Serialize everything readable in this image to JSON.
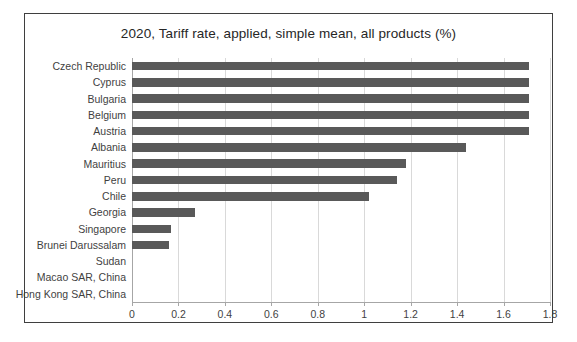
{
  "chart_data": {
    "type": "bar",
    "orientation": "horizontal",
    "title": "2020, Tariff rate, applied, simple mean, all products (%)",
    "xlabel": "",
    "ylabel": "",
    "xlim": [
      0,
      1.8
    ],
    "xticks": [
      "0",
      "0.2",
      "0.4",
      "0.6",
      "0.8",
      "1",
      "1.2",
      "1.4",
      "1.6",
      "1.8"
    ],
    "xtick_values": [
      0,
      0.2,
      0.4,
      0.6,
      0.8,
      1,
      1.2,
      1.4,
      1.6,
      1.8
    ],
    "grid": true,
    "legend": false,
    "bar_color": "#595959",
    "categories": [
      "Czech Republic",
      "Cyprus",
      "Bulgaria",
      "Belgium",
      "Austria",
      "Albania",
      "Mauritius",
      "Peru",
      "Chile",
      "Georgia",
      "Singapore",
      "Brunei Darussalam",
      "Sudan",
      "Macao SAR, China",
      "Hong Kong SAR, China"
    ],
    "values": [
      1.71,
      1.71,
      1.71,
      1.71,
      1.71,
      1.44,
      1.18,
      1.14,
      1.02,
      0.27,
      0.17,
      0.16,
      0,
      0,
      0
    ]
  }
}
